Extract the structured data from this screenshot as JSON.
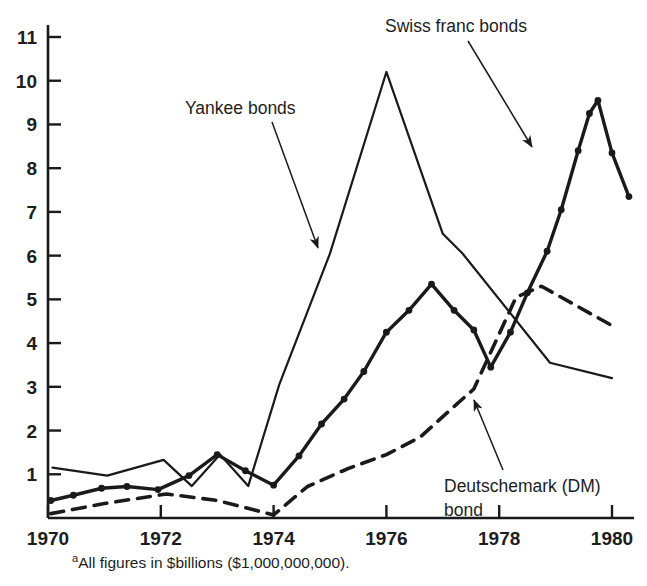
{
  "chart_data": {
    "type": "line",
    "title": "",
    "subtitle": "",
    "xlabel": "",
    "ylabel": "",
    "xlim": [
      1970,
      1980
    ],
    "ylim": [
      0,
      11.4
    ],
    "grid": false,
    "legend_position": "inline-annotations",
    "x_ticks": [
      1970,
      1972,
      1974,
      1976,
      1978,
      1980
    ],
    "x_tick_labels": [
      "1970",
      "1972",
      "1974",
      "1976",
      "1978",
      "1980"
    ],
    "y_ticks": [
      1,
      2,
      3,
      4,
      5,
      6,
      7,
      8,
      9,
      10,
      11
    ],
    "y_tick_labels": [
      "1",
      "2",
      "3",
      "4",
      "5",
      "6",
      "7",
      "8",
      "9",
      "10",
      "11"
    ],
    "units_note": "All figures in $billions ($1,000,000,000).",
    "series": [
      {
        "name": "Yankee bonds",
        "style": "solid-thin",
        "markers": false,
        "color": "#1a1a1a",
        "points": [
          [
            1970.08,
            1.15
          ],
          [
            1971.05,
            0.97
          ],
          [
            1972.05,
            1.33
          ],
          [
            1972.55,
            0.73
          ],
          [
            1973.05,
            1.45
          ],
          [
            1973.55,
            0.73
          ],
          [
            1974.1,
            3.05
          ],
          [
            1975.0,
            6.05
          ],
          [
            1976.0,
            10.2
          ],
          [
            1977.0,
            6.5
          ],
          [
            1977.35,
            6.05
          ],
          [
            1978.9,
            3.55
          ],
          [
            1980.0,
            3.2
          ]
        ]
      },
      {
        "name": "Swiss franc bonds",
        "style": "solid-thick",
        "markers": true,
        "color": "#1a1a1a",
        "points": [
          [
            1970.05,
            0.4
          ],
          [
            1970.45,
            0.52
          ],
          [
            1970.95,
            0.68
          ],
          [
            1971.4,
            0.72
          ],
          [
            1971.95,
            0.65
          ],
          [
            1972.5,
            0.97
          ],
          [
            1973.0,
            1.45
          ],
          [
            1973.5,
            1.08
          ],
          [
            1974.0,
            0.75
          ],
          [
            1974.45,
            1.42
          ],
          [
            1974.85,
            2.15
          ],
          [
            1975.25,
            2.72
          ],
          [
            1975.6,
            3.35
          ],
          [
            1976.0,
            4.25
          ],
          [
            1976.4,
            4.75
          ],
          [
            1976.8,
            5.35
          ],
          [
            1977.2,
            4.75
          ],
          [
            1977.55,
            4.3
          ],
          [
            1977.85,
            3.45
          ],
          [
            1978.2,
            4.25
          ],
          [
            1978.5,
            5.15
          ],
          [
            1978.85,
            6.1
          ],
          [
            1979.1,
            7.05
          ],
          [
            1979.4,
            8.4
          ],
          [
            1979.6,
            9.25
          ],
          [
            1979.75,
            9.55
          ],
          [
            1980.0,
            8.35
          ],
          [
            1980.3,
            7.35
          ]
        ]
      },
      {
        "name": "Deutschemark (DM) bond",
        "style": "dashed",
        "markers": false,
        "color": "#1a1a1a",
        "points": [
          [
            1970.05,
            0.1
          ],
          [
            1971.0,
            0.33
          ],
          [
            1972.1,
            0.55
          ],
          [
            1973.0,
            0.4
          ],
          [
            1974.0,
            0.07
          ],
          [
            1974.6,
            0.72
          ],
          [
            1975.3,
            1.12
          ],
          [
            1976.0,
            1.45
          ],
          [
            1976.6,
            1.85
          ],
          [
            1977.2,
            2.55
          ],
          [
            1977.55,
            2.95
          ],
          [
            1978.3,
            5.05
          ],
          [
            1978.75,
            5.3
          ],
          [
            1980.0,
            4.4
          ]
        ]
      }
    ],
    "annotations": [
      {
        "id": "yankee",
        "text": "Yankee bonds",
        "label_x": 185,
        "label_y": 114,
        "anchor": "start",
        "arrow_from_x": 272,
        "arrow_from_y": 122,
        "arrow_to_x": 318,
        "arrow_to_y": 248
      },
      {
        "id": "swiss",
        "text": "Swiss franc bonds",
        "label_x": 385,
        "label_y": 32,
        "anchor": "start",
        "arrow_from_x": 468,
        "arrow_from_y": 41,
        "arrow_to_x": 532,
        "arrow_to_y": 147
      },
      {
        "id": "dm",
        "text": "Deutschemark (DM)",
        "text_line2": "bond",
        "label_x": 444,
        "label_y": 492,
        "anchor": "start",
        "arrow_from_x": 503,
        "arrow_from_y": 470,
        "arrow_to_x": 474,
        "arrow_to_y": 400
      }
    ]
  },
  "axes": {
    "x_axis_name": "year-axis",
    "y_axis_name": "value-axis"
  },
  "footnote": {
    "marker": "a",
    "text": "All figures in $billions ($1,000,000,000)."
  },
  "colors": {
    "ink": "#1a1a1a",
    "background": "#ffffff"
  }
}
